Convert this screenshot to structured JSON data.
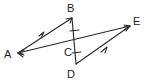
{
  "figure": {
    "type": "geometry-diagram",
    "background_color": "#ffffff",
    "line_color": "#2b2b2b",
    "label_color": "#1c1c1c",
    "width": 147,
    "height": 81
  },
  "points": {
    "A": {
      "label": "A",
      "x": 18,
      "y": 53,
      "label_x": 4,
      "label_y": 58
    },
    "B": {
      "label": "B",
      "x": 72,
      "y": 18,
      "label_x": 67,
      "label_y": 12
    },
    "C": {
      "label": "C",
      "x": 75,
      "y": 44,
      "label_x": 64,
      "label_y": 56
    },
    "D": {
      "label": "D",
      "x": 76,
      "y": 64,
      "label_x": 67,
      "label_y": 78
    },
    "E": {
      "label": "E",
      "x": 130,
      "y": 26,
      "label_x": 133,
      "label_y": 25
    }
  },
  "segments": [
    {
      "name": "segment-AB",
      "from": "A",
      "to": "B",
      "x1": 18,
      "y1": 53,
      "x2": 72,
      "y2": 18
    },
    {
      "name": "segment-BD",
      "from": "B",
      "to": "D",
      "x1": 72,
      "y1": 18,
      "x2": 76,
      "y2": 64
    },
    {
      "name": "segment-AE",
      "from": "A",
      "to": "E",
      "x1": 18,
      "y1": 53,
      "x2": 130,
      "y2": 26
    },
    {
      "name": "segment-DE",
      "from": "D",
      "to": "E",
      "x1": 76,
      "y1": 64,
      "x2": 130,
      "y2": 26
    }
  ],
  "arrowheads": [
    {
      "name": "arrowhead-at-B",
      "points": "66,19 72,18 70,23"
    },
    {
      "name": "arrowhead-at-E-upper",
      "points": "124,25 130,26 125,30"
    },
    {
      "name": "arrowhead-at-E-lower",
      "points": "124,27 130,26 126,31"
    },
    {
      "name": "arrowhead-at-A-upper",
      "points": "24,50 18,53 24,55"
    },
    {
      "name": "arrowhead-at-A-lower",
      "points": "23,54 18,53 23,57"
    }
  ],
  "parallel_marks": [
    {
      "name": "parallel-mark-AB",
      "description": "single chevron on segment AB",
      "points": "39,36 44,32 41,38"
    },
    {
      "name": "parallel-mark-DE",
      "description": "single chevron on segment DE",
      "points": "101,52 107,47 105,53"
    }
  ],
  "congruence_ticks": [
    {
      "name": "tick-on-BC",
      "x1": 70,
      "y1": 31,
      "x2": 79,
      "y2": 30
    },
    {
      "name": "tick-on-CD",
      "x1": 72,
      "y1": 53,
      "x2": 81,
      "y2": 52
    }
  ],
  "annotations": {
    "congruent_pair": "BC = CD",
    "parallel_pair": "AB parallel to DE"
  }
}
